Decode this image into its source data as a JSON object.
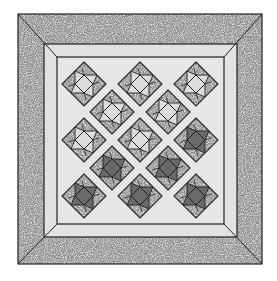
{
  "image": {
    "subject": "quilt-pattern-illustration",
    "alt": "Grayscale quilt diagram: mitered speckled outer border, light inner band, and an X-shaped arrangement of on-point pinwheel/star blocks"
  },
  "colors": {
    "background": "#ffffff",
    "outer_border": "#a8a8a8",
    "light_band": "#e2e2e2",
    "field": "#e6e6e6",
    "print_mid": "#9a9a9a",
    "light_patch": "#dcdcdc",
    "dark_patch": "#6a6a6a",
    "line": "#222222"
  },
  "layout": {
    "outer": [
      18,
      14,
      262,
      264
    ],
    "mid": [
      44,
      44,
      237,
      237
    ],
    "inner": [
      57,
      57,
      224,
      224
    ]
  },
  "blocks": [
    {
      "cx": 84,
      "cy": 84,
      "shade": "light"
    },
    {
      "cx": 140,
      "cy": 84,
      "shade": "light"
    },
    {
      "cx": 196,
      "cy": 84,
      "shade": "light"
    },
    {
      "cx": 112,
      "cy": 112,
      "shade": "light"
    },
    {
      "cx": 168,
      "cy": 112,
      "shade": "light"
    },
    {
      "cx": 84,
      "cy": 140,
      "shade": "light"
    },
    {
      "cx": 140,
      "cy": 140,
      "shade": "light"
    },
    {
      "cx": 196,
      "cy": 140,
      "shade": "dark"
    },
    {
      "cx": 112,
      "cy": 168,
      "shade": "dark"
    },
    {
      "cx": 168,
      "cy": 168,
      "shade": "dark"
    },
    {
      "cx": 84,
      "cy": 196,
      "shade": "dark"
    },
    {
      "cx": 140,
      "cy": 196,
      "shade": "dark"
    },
    {
      "cx": 196,
      "cy": 196,
      "shade": "dark"
    }
  ]
}
